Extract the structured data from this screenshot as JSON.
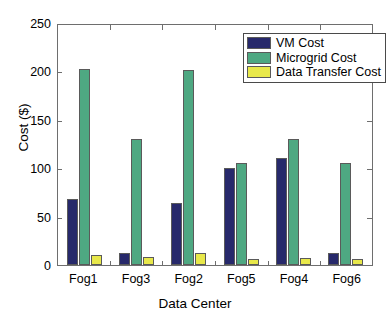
{
  "chart_data": {
    "type": "bar",
    "title": "",
    "xlabel": "Data Center",
    "ylabel": "Cost ($)",
    "categories": [
      "Fog1",
      "Fog3",
      "Fog2",
      "Fog5",
      "Fog4",
      "Fog6"
    ],
    "series": [
      {
        "name": "VM Cost",
        "color": "#27296b",
        "values": [
          68,
          12,
          64,
          100,
          111,
          12
        ]
      },
      {
        "name": "Microgrid Cost",
        "color": "#4ea882",
        "values": [
          202,
          130,
          201,
          105,
          130,
          105
        ]
      },
      {
        "name": "Data Transfer Cost",
        "color": "#e8e84a",
        "values": [
          10,
          8,
          12,
          6,
          7,
          6
        ]
      }
    ],
    "ylim": [
      0,
      250
    ],
    "yticks": [
      0,
      50,
      100,
      150,
      200,
      250
    ],
    "ytick_labels": [
      "0",
      "50",
      "100",
      "150",
      "200",
      "250"
    ],
    "grid": false,
    "legend_position": "top-right",
    "axis_color": "#6e6e6e",
    "background": "#ffffff"
  },
  "legend": {
    "entries": [
      {
        "label": "VM Cost"
      },
      {
        "label": "Microgrid Cost"
      },
      {
        "label": "Data Transfer Cost"
      }
    ]
  }
}
